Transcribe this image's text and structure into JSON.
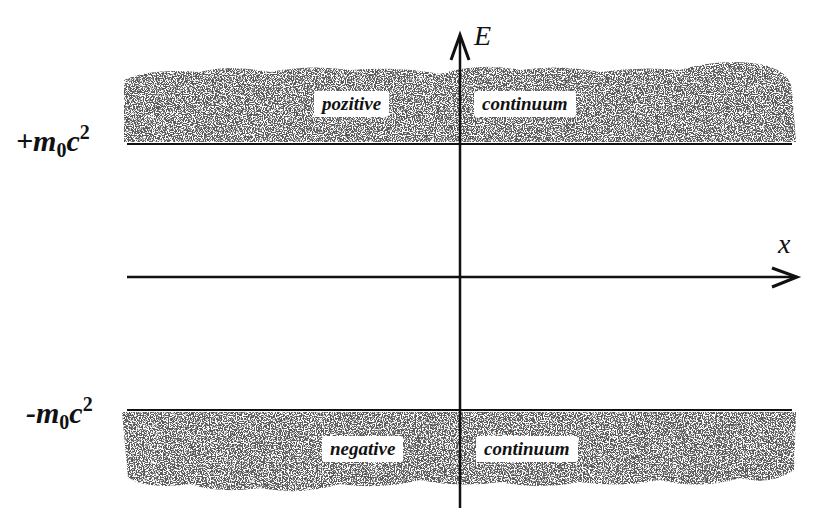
{
  "diagram": {
    "axes": {
      "vertical": {
        "label": "E"
      },
      "horizontal": {
        "label": "x"
      }
    },
    "levels": [
      {
        "id": "upper",
        "sign": "+",
        "mass": "m",
        "subscript": "0",
        "c": "c",
        "superscript": "2"
      },
      {
        "id": "lower",
        "sign": "-",
        "mass": "m",
        "subscript": "0",
        "c": "c",
        "superscript": "2"
      }
    ],
    "bands": {
      "positive": {
        "left_label": "pozitive",
        "right_label": "continuum"
      },
      "negative": {
        "left_label": "negative",
        "right_label": "continuum"
      }
    },
    "colors": {
      "line": "#111111",
      "noise": "#333333",
      "background": "#ffffff"
    }
  }
}
